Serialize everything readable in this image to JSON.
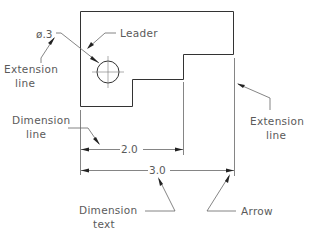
{
  "diagram": {
    "type": "technical-drawing-dimensioning",
    "labels": {
      "leader": "Leader",
      "extension_line_left_1": "Extension",
      "extension_line_left_2": "line",
      "extension_line_right_1": "Extension",
      "extension_line_right_2": "line",
      "dimension_line_1": "Dimension",
      "dimension_line_2": "line",
      "dimension_text_1": "Dimension",
      "dimension_text_2": "text",
      "arrow": "Arrow"
    },
    "dimensions": {
      "hole_diameter": "ø.3",
      "inner_width": "2.0",
      "overall_width": "3.0"
    },
    "colors": {
      "object_line": "#333333",
      "annotation_line": "#666666",
      "text": "#5a5a5a"
    }
  }
}
